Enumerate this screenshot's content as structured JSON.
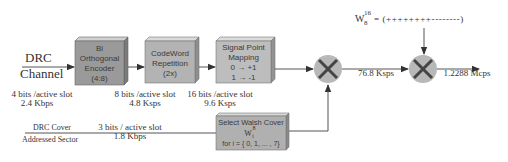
{
  "diagram": {
    "input": {
      "line1": "DRC",
      "line2": "Channel"
    },
    "blocks": [
      {
        "id": "bi-orthogonal-encoder",
        "lines": [
          "Bi",
          "Orthogonal",
          "Encoder",
          "(4:8)"
        ],
        "fill": "#9a9a9a"
      },
      {
        "id": "codeword-repetition",
        "lines": [
          "CodeWord",
          "Repetition",
          "(2x)"
        ],
        "fill": "#b3b3b3"
      },
      {
        "id": "signal-point-mapping",
        "lines": [
          "Signal Point",
          "Mapping",
          "0 → +1",
          "1 → -1"
        ],
        "fill": "#bdbdbd"
      },
      {
        "id": "select-walsh-cover",
        "lines": [
          "Select Walsh Cover",
          "W",
          "i",
          "8",
          "for i = { 0, 1, ... , 7}"
        ],
        "fill": "#b0b0b0"
      }
    ],
    "rates": [
      {
        "line1": "4 bits /active slot",
        "line2": "2.4 Kbps"
      },
      {
        "line1": "8 bits /active slot",
        "line2": "4.8 Ksps"
      },
      {
        "line1": "16 bits /active slot",
        "line2": "9.6 Ksps"
      },
      {
        "line1": "",
        "line2": "76.8 Ksps"
      },
      {
        "line1": "",
        "line2": "1.2288 Mcps"
      }
    ],
    "cover_input": {
      "line1": "DRC Cover",
      "line2": "Addressed Sector",
      "rate1": "3 bits / active slot",
      "rate2": "1.8 Kbps"
    },
    "walsh16": {
      "base": "W",
      "sub": "8",
      "sup": "16",
      "sequence": "= (++++++++--------)"
    },
    "multipliers": [
      {
        "symbol": "×"
      },
      {
        "symbol": "×"
      }
    ],
    "colors": {
      "line": "#555555",
      "multiplier_fill": "#b8b8b8",
      "multiplier_x": "#444444"
    }
  }
}
